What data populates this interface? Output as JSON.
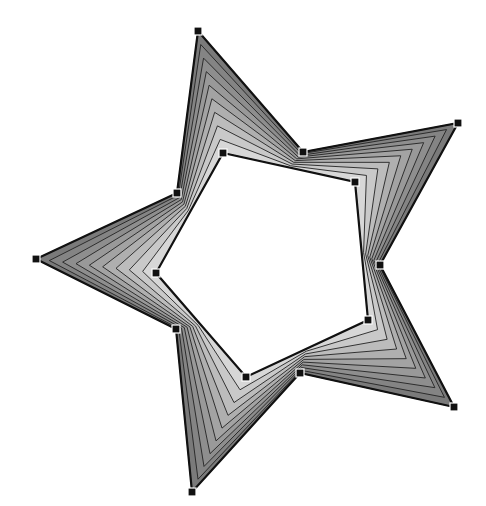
{
  "diagram": {
    "canvas": {
      "width": 486,
      "height": 506,
      "background": "#ffffff"
    },
    "outer_star": {
      "points": [
        [
          198,
          31
        ],
        [
          303,
          152
        ],
        [
          458,
          123
        ],
        [
          380,
          265
        ],
        [
          454,
          407
        ],
        [
          300,
          373
        ],
        [
          192,
          492
        ],
        [
          176,
          329
        ],
        [
          36,
          259
        ],
        [
          177,
          193
        ]
      ],
      "stroke": "#111111",
      "stroke_width": 2.2
    },
    "inner_pentagon": {
      "points": [
        [
          223,
          153
        ],
        [
          355,
          182
        ],
        [
          368,
          320
        ],
        [
          246,
          377
        ],
        [
          156,
          273
        ]
      ],
      "stroke": "#111111",
      "stroke_width": 2.2,
      "fill": "#ffffff"
    },
    "blend": {
      "steps": 9,
      "colors": {
        "dark": "#7a7a7a",
        "mid": "#a8a8a8",
        "light": "#e4e4e4"
      },
      "band_stroke": "#222222",
      "band_stroke_width": 0.9
    },
    "handles": {
      "size": 8,
      "fill": "#111111",
      "stroke": "#ffffff"
    }
  }
}
